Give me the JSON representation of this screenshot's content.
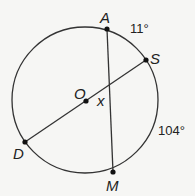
{
  "diagram": {
    "type": "circle-with-chords",
    "colors": {
      "stroke": "#333333",
      "point": "#111111",
      "text": "#222222",
      "background": "#f6f6f4"
    },
    "center_label": "O",
    "points": [
      {
        "id": "A",
        "label": "A"
      },
      {
        "id": "S",
        "label": "S"
      },
      {
        "id": "D",
        "label": "D"
      },
      {
        "id": "M",
        "label": "M"
      }
    ],
    "segments": [
      {
        "from": "A",
        "to": "M",
        "kind": "chord"
      },
      {
        "from": "D",
        "to": "S",
        "kind": "diameter"
      }
    ],
    "angle_label": "x",
    "arc_labels": [
      {
        "arc": "AS",
        "label": "11°"
      },
      {
        "arc": "SM",
        "label": "104°"
      }
    ]
  }
}
